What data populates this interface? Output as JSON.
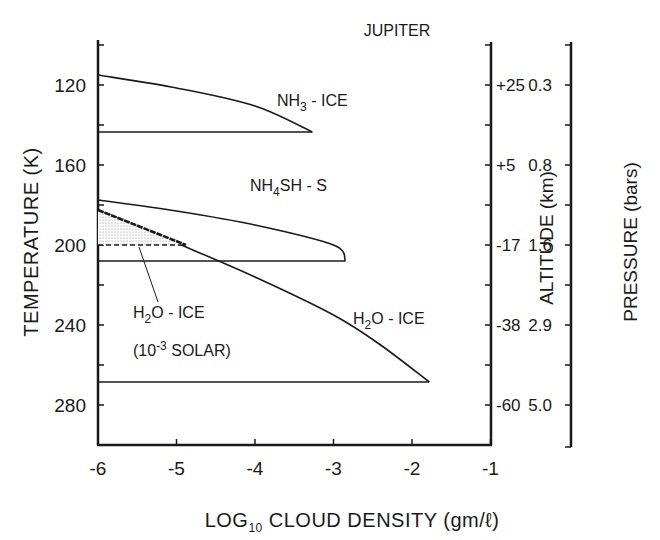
{
  "chart_data": {
    "type": "line",
    "title": "JUPITER",
    "xlabel": "LOG10 CLOUD DENSITY (gm/ℓ)",
    "xlabel_parts": {
      "main": "LOG",
      "sub": "10",
      "rest": " CLOUD DENSITY (gm/ℓ)"
    },
    "ylabel": "TEMPERATURE (K)",
    "xlim": [
      -6,
      -1
    ],
    "ylim": [
      100,
      300
    ],
    "y_inverted": true,
    "grid": false,
    "x_ticks": [
      -6,
      -5,
      -4,
      -3,
      -2,
      -1
    ],
    "x_tick_labels": [
      "-6",
      "-5",
      "-4",
      "-3",
      "-2",
      "-1"
    ],
    "y_ticks_major": [
      120,
      160,
      200,
      240,
      280
    ],
    "y_tick_labels": [
      "120",
      "160",
      "200",
      "240",
      "280"
    ],
    "y_ticks_minor": [
      100,
      140,
      180,
      220,
      260
    ],
    "secondary_axes": [
      {
        "name": "altitude",
        "label": "ALTITUDE (km)",
        "tick_temperatures": [
          120,
          160,
          200,
          240,
          280
        ],
        "tick_labels": [
          "+25",
          "+5",
          "-17",
          "-38",
          "-60"
        ]
      },
      {
        "name": "pressure",
        "label": "PRESSURE (bars)",
        "tick_temperatures": [
          120,
          160,
          200,
          240,
          280
        ],
        "tick_labels": [
          "0.3",
          "0.8",
          "1.6",
          "2.9",
          "5.0"
        ]
      }
    ],
    "series": [
      {
        "name": "NH3-ICE",
        "label_main": "NH",
        "label_sub": "3",
        "label_rest": " - ICE",
        "cloud_top_T": 115,
        "cloud_base_T": 143.5,
        "peak_log_density": -3.27,
        "points": [
          [
            -6,
            115
          ],
          [
            -5,
            121.5
          ],
          [
            -4,
            130.5
          ],
          [
            -3.27,
            143.5
          ]
        ],
        "base_line": [
          [
            -6,
            143.5
          ],
          [
            -3.27,
            143.5
          ]
        ]
      },
      {
        "name": "NH4SH-S",
        "label_main": "NH",
        "label_sub": "4",
        "label_rest": "SH - S",
        "cloud_top_T": 177.5,
        "cloud_base_T": 208,
        "peak_log_density": -2.85,
        "points": [
          [
            -6,
            177.5
          ],
          [
            -5,
            183
          ],
          [
            -4,
            190
          ],
          [
            -3,
            200
          ],
          [
            -2.85,
            208
          ]
        ],
        "base_line": [
          [
            -6,
            208
          ],
          [
            -2.85,
            208
          ]
        ]
      },
      {
        "name": "H2O-ICE",
        "label_main": "H",
        "label_sub": "2",
        "label_rest": "O - ICE",
        "cloud_top_T": 182.5,
        "cloud_base_T": 268.5,
        "peak_log_density": -1.78,
        "points": [
          [
            -6,
            182.5
          ],
          [
            -5,
            199
          ],
          [
            -4,
            216
          ],
          [
            -3,
            235
          ],
          [
            -2.4,
            250
          ],
          [
            -1.78,
            268.5
          ]
        ],
        "base_line": [
          [
            -6,
            268.5
          ],
          [
            -1.78,
            268.5
          ]
        ]
      },
      {
        "name": "H2O-ICE (10^-3 SOLAR)",
        "label_main": "H",
        "label_sub": "2",
        "label_rest": "O - ICE",
        "label_line2_pre": "(10",
        "label_line2_sup": "-3",
        "label_line2_post": " SOLAR)",
        "style": "dashed, shaded",
        "cloud_top_T": 182.5,
        "cloud_base_T": 200,
        "peak_log_density": -4.88,
        "points": [
          [
            -6,
            182.5
          ],
          [
            -4.88,
            200
          ]
        ],
        "base_line": [
          [
            -6,
            200
          ],
          [
            -4.88,
            200
          ]
        ]
      }
    ],
    "annotations": [
      "JUPITER",
      "NH3 - ICE",
      "NH4SH - S",
      "H2O - ICE",
      "H2O - ICE (10^-3 SOLAR)"
    ]
  }
}
